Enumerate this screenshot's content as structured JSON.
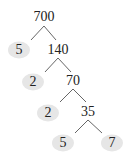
{
  "diagram": {
    "type": "factor-tree",
    "root": "700",
    "nodes": [
      {
        "id": "n700",
        "value": "700",
        "x": 44,
        "y": 17,
        "prime": false
      },
      {
        "id": "n5a",
        "value": "5",
        "x": 19,
        "y": 50,
        "prime": true
      },
      {
        "id": "n140",
        "value": "140",
        "x": 58,
        "y": 50,
        "prime": false
      },
      {
        "id": "n2a",
        "value": "2",
        "x": 33,
        "y": 82,
        "prime": true
      },
      {
        "id": "n70",
        "value": "70",
        "x": 73,
        "y": 81,
        "prime": false
      },
      {
        "id": "n2b",
        "value": "2",
        "x": 48,
        "y": 113,
        "prime": true
      },
      {
        "id": "n35",
        "value": "35",
        "x": 88,
        "y": 112,
        "prime": false
      },
      {
        "id": "n5b",
        "value": "5",
        "x": 63,
        "y": 143,
        "prime": true
      },
      {
        "id": "n7",
        "value": "7",
        "x": 112,
        "y": 143,
        "prime": true
      }
    ],
    "edges": [
      [
        "n700",
        "n5a"
      ],
      [
        "n700",
        "n140"
      ],
      [
        "n140",
        "n2a"
      ],
      [
        "n140",
        "n70"
      ],
      [
        "n70",
        "n2b"
      ],
      [
        "n70",
        "n35"
      ],
      [
        "n35",
        "n5b"
      ],
      [
        "n35",
        "n7"
      ]
    ],
    "colors": {
      "leaf_fill": "#e6e6e6",
      "line": "#555555",
      "text": "#222222"
    }
  }
}
